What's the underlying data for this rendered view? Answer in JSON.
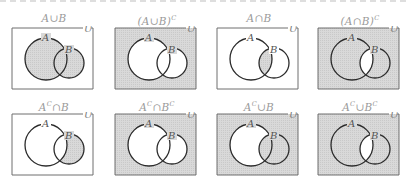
{
  "figure": {
    "universe_label": "U",
    "set_a_label": "A",
    "set_b_label": "B",
    "shade_color": "#d9d9d9",
    "line_color": "#2b2b2b",
    "caption_color": "#9a9a9a"
  },
  "panels": [
    {
      "caption": "A∪B",
      "shade": {
        "outside": false,
        "a_only": true,
        "lens": true,
        "b_only": true
      }
    },
    {
      "caption": "(A∪B)",
      "sup": "C",
      "shade": {
        "outside": true,
        "a_only": false,
        "lens": false,
        "b_only": false
      }
    },
    {
      "caption": "A∩B",
      "shade": {
        "outside": false,
        "a_only": false,
        "lens": true,
        "b_only": false
      }
    },
    {
      "caption": "(A∩B)",
      "sup": "C",
      "shade": {
        "outside": true,
        "a_only": true,
        "lens": false,
        "b_only": true
      }
    },
    {
      "caption": "A",
      "sup": "C",
      "caption_rest": "∩B",
      "shade": {
        "outside": false,
        "a_only": false,
        "lens": false,
        "b_only": true
      }
    },
    {
      "caption": "A",
      "sup": "C",
      "caption_rest": "∩B",
      "sup2": "C",
      "shade": {
        "outside": true,
        "a_only": false,
        "lens": false,
        "b_only": false
      }
    },
    {
      "caption": "A",
      "sup": "C",
      "caption_rest": "∪B",
      "shade": {
        "outside": true,
        "a_only": false,
        "lens": true,
        "b_only": true
      }
    },
    {
      "caption": "A",
      "sup": "C",
      "caption_rest": "∪B",
      "sup2": "C",
      "shade": {
        "outside": true,
        "a_only": true,
        "lens": false,
        "b_only": true
      }
    }
  ]
}
